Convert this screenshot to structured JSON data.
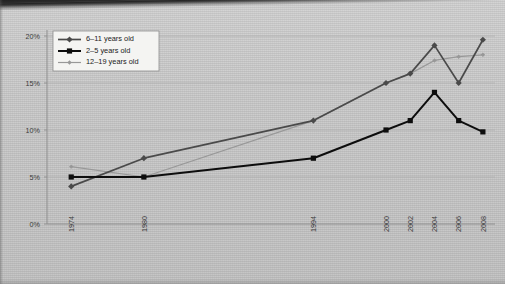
{
  "chart_data": {
    "type": "line",
    "title": "",
    "xlabel": "",
    "ylabel": "",
    "x": [
      1974,
      1980,
      1994,
      2000,
      2002,
      2004,
      2006,
      2008
    ],
    "xtick_labels": [
      "1974",
      "1980",
      "1994",
      "2000",
      "2002",
      "2004",
      "2006",
      "2008"
    ],
    "ytick_labels": [
      "0%",
      "5%",
      "10%",
      "15%",
      "20%"
    ],
    "ytick_values": [
      0,
      5,
      10,
      15,
      20
    ],
    "ylim": [
      0,
      20
    ],
    "xlim": [
      1972,
      2009
    ],
    "grid": "horizontal",
    "legend_position": "top-left",
    "series": [
      {
        "name": "6–11 years old",
        "color": "#4a4a4a",
        "marker": "diamond",
        "x": [
          1974,
          1980,
          1994,
          2000,
          2002,
          2004,
          2006,
          2008
        ],
        "values": [
          4.0,
          7.0,
          11.0,
          15.0,
          16.0,
          19.0,
          15.0,
          19.6
        ]
      },
      {
        "name": "2–5 years old",
        "color": "#0d0d0d",
        "marker": "square",
        "x": [
          1974,
          1980,
          1994,
          2000,
          2002,
          2004,
          2006,
          2008
        ],
        "values": [
          5.0,
          5.0,
          7.0,
          10.0,
          11.0,
          14.0,
          11.0,
          9.8
        ]
      },
      {
        "name": "12–19 years old",
        "color": "#989898",
        "marker": "small-diamond",
        "x": [
          1974,
          1980,
          1994,
          2000,
          2002,
          2004,
          2006,
          2008
        ],
        "values": [
          6.1,
          5.0,
          11.0,
          15.0,
          16.0,
          17.4,
          17.8,
          18.0
        ]
      }
    ],
    "colors": {
      "background": "#c8c8c8",
      "gridline": "#b0b0b0",
      "axis": "#8f8f8f",
      "text": "#3a3a3a",
      "legend_bg": "#f4f4f2",
      "legend_border": "#8e8e8e"
    }
  },
  "legend": {
    "entries": [
      {
        "label": "6–11 years old"
      },
      {
        "label": "2–5 years old"
      },
      {
        "label": "12–19 years old"
      }
    ]
  }
}
